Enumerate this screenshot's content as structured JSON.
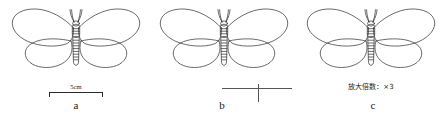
{
  "figure": {
    "background_color": "#ffffff",
    "line_color": "#2b2b2b"
  },
  "panels": [
    {
      "id": "a",
      "letter": "a",
      "annotation_type": "scale-bar",
      "scale_bar": {
        "label": "5cm",
        "value": 5,
        "unit": "cm"
      }
    },
    {
      "id": "b",
      "letter": "b",
      "annotation_type": "cross-rule",
      "cross_rule": {
        "label": ""
      }
    },
    {
      "id": "c",
      "letter": "c",
      "annotation_type": "magnification-text",
      "magnification": {
        "text": "放大倍数：×3",
        "factor": 3
      }
    }
  ]
}
